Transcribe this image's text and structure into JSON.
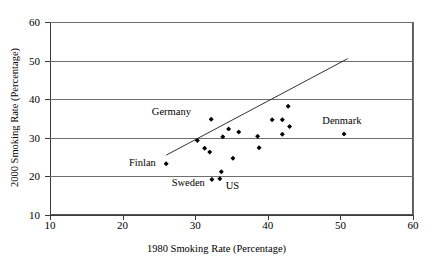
{
  "chart_data": {
    "type": "scatter",
    "title": "",
    "xlabel": "1980 Smoking Rate (Percentage)",
    "ylabel": "2000 Smoking Rate (Percentage)",
    "xlim": [
      10,
      60
    ],
    "ylim": [
      10,
      60
    ],
    "xticks": [
      10,
      20,
      30,
      40,
      50,
      60
    ],
    "yticks": [
      10,
      20,
      30,
      40,
      50,
      60
    ],
    "grid": "horizontal",
    "legend": "none",
    "marker": "filled-diamond",
    "marker_color": "#000000",
    "points": [
      {
        "x": 26.0,
        "y": 23.3,
        "label": "Finlan"
      },
      {
        "x": 30.3,
        "y": 29.3,
        "label": ""
      },
      {
        "x": 31.3,
        "y": 27.3,
        "label": ""
      },
      {
        "x": 32.0,
        "y": 26.3,
        "label": ""
      },
      {
        "x": 32.2,
        "y": 34.8,
        "label": "Germany"
      },
      {
        "x": 32.3,
        "y": 19.2,
        "label": "Sweden"
      },
      {
        "x": 33.4,
        "y": 19.4,
        "label": "US"
      },
      {
        "x": 33.6,
        "y": 21.2,
        "label": ""
      },
      {
        "x": 33.8,
        "y": 30.3,
        "label": ""
      },
      {
        "x": 34.6,
        "y": 32.3,
        "label": ""
      },
      {
        "x": 35.2,
        "y": 24.7,
        "label": ""
      },
      {
        "x": 36.0,
        "y": 31.5,
        "label": ""
      },
      {
        "x": 38.6,
        "y": 30.4,
        "label": ""
      },
      {
        "x": 38.8,
        "y": 27.4,
        "label": ""
      },
      {
        "x": 40.6,
        "y": 34.7,
        "label": ""
      },
      {
        "x": 42.0,
        "y": 34.7,
        "label": ""
      },
      {
        "x": 42.0,
        "y": 30.9,
        "label": ""
      },
      {
        "x": 42.8,
        "y": 38.2,
        "label": ""
      },
      {
        "x": 43.0,
        "y": 32.9,
        "label": ""
      },
      {
        "x": 50.5,
        "y": 31.0,
        "label": "Denmark"
      }
    ],
    "reference_line": {
      "name": "identity-line",
      "x0": 26.0,
      "y0": 25.5,
      "x1": 51.0,
      "y1": 50.5,
      "color": "#333333"
    },
    "annotations": [
      {
        "text": "Germany",
        "x": 29.4,
        "y": 36.6,
        "anchor": "end"
      },
      {
        "text": "Denmark",
        "x": 50.2,
        "y": 34.3,
        "anchor": "middle"
      },
      {
        "text": "Finlan",
        "x": 24.6,
        "y": 23.4,
        "anchor": "end"
      },
      {
        "text": "Sweden",
        "x": 31.3,
        "y": 18.4,
        "anchor": "end"
      },
      {
        "text": "US",
        "x": 34.2,
        "y": 17.4,
        "anchor": "start"
      }
    ]
  }
}
